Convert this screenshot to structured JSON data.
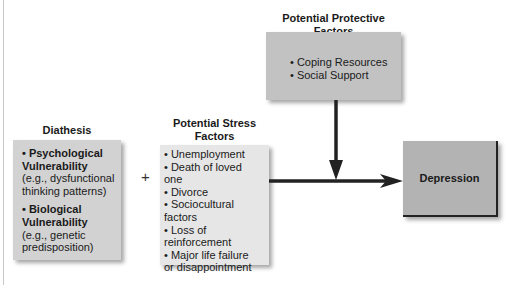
{
  "diagram": {
    "diathesis": {
      "title": "Diathesis",
      "items": [
        {
          "bullet": "• Psychological",
          "bold2": "Vulnerability",
          "detail1": "(e.g., dysfunctional",
          "detail2": "thinking patterns)"
        },
        {
          "bullet": "• Biological",
          "bold2": "Vulnerability",
          "detail1": "(e.g., genetic",
          "detail2": "predisposition)"
        }
      ]
    },
    "operator": "+",
    "stress": {
      "title_line1": "Potential Stress",
      "title_line2": "Factors",
      "lines": [
        "• Unemployment",
        "• Death of loved",
        "one",
        "• Divorce",
        "• Sociocultural",
        "factors",
        "• Loss of",
        "reinforcement",
        "• Major life failure",
        "or disappointment"
      ]
    },
    "protective": {
      "title": "Potential Protective Factors",
      "items": [
        "• Coping Resources",
        "• Social Support"
      ]
    },
    "outcome": {
      "label": "Depression"
    },
    "colors": {
      "diathesis_fill": "#d2d2d2",
      "stress_fill": "#e6e6e6",
      "protective_fill": "#c2c2c2",
      "outcome_fill": "#b3b3b3",
      "arrow": "#222222"
    }
  }
}
